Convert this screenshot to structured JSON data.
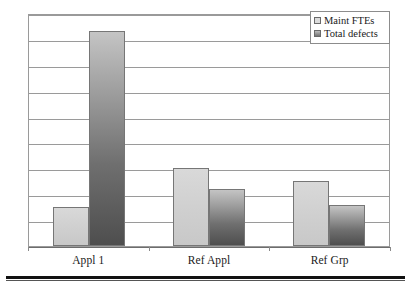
{
  "chart_data": {
    "type": "bar",
    "title": "",
    "subtitle": "",
    "xlabel": "",
    "ylabel": "",
    "categories": [
      "Appl 1",
      "Ref Appl",
      "Ref Grp"
    ],
    "series": [
      {
        "name": "Maint FTEs",
        "values": [
          1.5,
          3.0,
          2.5
        ],
        "color": "#d0d0d0"
      },
      {
        "name": "Total defects",
        "values": [
          8.3,
          2.2,
          1.6
        ],
        "color": "#6f6f6f"
      }
    ],
    "ylim": [
      0,
      9
    ],
    "y_gridline_values": [
      1,
      2,
      3,
      4,
      5,
      6,
      7,
      8,
      9
    ],
    "y_tick_labels": [],
    "grid": true,
    "grid_axis": "y",
    "legend": true,
    "legend_position": "top-right"
  },
  "legend": {
    "items": [
      {
        "label": "Maint FTEs",
        "swatch": "light-gray-swatch"
      },
      {
        "label": "Total defects",
        "swatch": "dark-gray-swatch"
      }
    ]
  },
  "axis": {
    "category_labels": [
      "Appl 1",
      "Ref Appl",
      "Ref Grp"
    ]
  }
}
